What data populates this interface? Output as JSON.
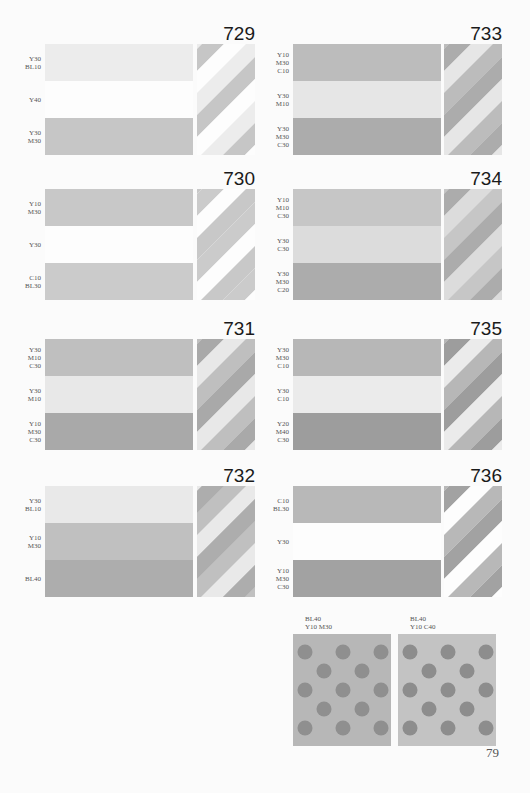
{
  "page_number": "79",
  "samples": [
    {
      "id": "729",
      "bands": [
        {
          "label": [
            "Y30",
            "BL10"
          ],
          "color": "#ececec"
        },
        {
          "label": [
            "Y40"
          ],
          "color": "#fdfdfd"
        },
        {
          "label": [
            "Y30",
            "M30"
          ],
          "color": "#c6c6c6"
        }
      ]
    },
    {
      "id": "730",
      "bands": [
        {
          "label": [
            "Y10",
            "M30"
          ],
          "color": "#c8c8c8"
        },
        {
          "label": [
            "Y30"
          ],
          "color": "#fdfdfd"
        },
        {
          "label": [
            "C10",
            "BL30"
          ],
          "color": "#cbcbcb"
        }
      ]
    },
    {
      "id": "731",
      "bands": [
        {
          "label": [
            "Y30",
            "M10",
            "C30"
          ],
          "color": "#bfbfbf"
        },
        {
          "label": [
            "Y30",
            "M10"
          ],
          "color": "#e8e8e8"
        },
        {
          "label": [
            "Y10",
            "M30",
            "C30"
          ],
          "color": "#a9a9a9"
        }
      ]
    },
    {
      "id": "732",
      "bands": [
        {
          "label": [
            "Y30",
            "BL10"
          ],
          "color": "#e9e9e9"
        },
        {
          "label": [
            "Y10",
            "M30"
          ],
          "color": "#c0c0c0"
        },
        {
          "label": [
            "BL40"
          ],
          "color": "#adadad"
        }
      ]
    },
    {
      "id": "733",
      "bands": [
        {
          "label": [
            "Y10",
            "M30",
            "C10"
          ],
          "color": "#bcbcbc"
        },
        {
          "label": [
            "Y30",
            "M10"
          ],
          "color": "#e6e6e6"
        },
        {
          "label": [
            "Y30",
            "M30",
            "C30"
          ],
          "color": "#acacac"
        }
      ]
    },
    {
      "id": "734",
      "bands": [
        {
          "label": [
            "Y10",
            "M10",
            "C30"
          ],
          "color": "#c6c6c6"
        },
        {
          "label": [
            "Y30",
            "C30"
          ],
          "color": "#dcdcdc"
        },
        {
          "label": [
            "Y30",
            "M30",
            "C20"
          ],
          "color": "#acacac"
        }
      ]
    },
    {
      "id": "735",
      "bands": [
        {
          "label": [
            "Y30",
            "M30",
            "C10"
          ],
          "color": "#b7b7b7"
        },
        {
          "label": [
            "Y30",
            "C10"
          ],
          "color": "#ebebeb"
        },
        {
          "label": [
            "Y20",
            "M40",
            "C30"
          ],
          "color": "#9d9d9d"
        }
      ]
    },
    {
      "id": "736",
      "bands": [
        {
          "label": [
            "C10",
            "BL30"
          ],
          "color": "#b8b8b8"
        },
        {
          "label": [
            "Y30"
          ],
          "color": "#fdfdfd"
        },
        {
          "label": [
            "Y10",
            "M30",
            "C30"
          ],
          "color": "#a2a2a2"
        }
      ]
    }
  ],
  "dot_patterns": [
    {
      "label_line1": "BL40",
      "label_line2": "Y10  M30",
      "bg": "#b7b7b7",
      "dot": "#8f8f8f"
    },
    {
      "label_line1": "BL40",
      "label_line2": "Y10  C40",
      "bg": "#c3c3c3",
      "dot": "#8d8d8d"
    }
  ]
}
